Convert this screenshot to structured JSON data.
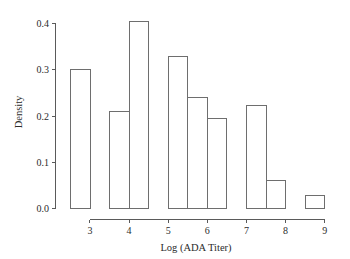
{
  "chart_data": {
    "type": "bar",
    "title": "",
    "subtitle": "",
    "xlabel": "Log (ADA Titer)",
    "ylabel": "Density",
    "xlim": [
      2.35,
      9.15
    ],
    "ylim": [
      0.0,
      0.42
    ],
    "grid": false,
    "legend": null,
    "bin_width": 0.5,
    "x_ticks": [
      3,
      4,
      5,
      6,
      7,
      8,
      9
    ],
    "x_tick_labels": [
      "3",
      "4",
      "5",
      "6",
      "7",
      "8",
      "9"
    ],
    "y_ticks": [
      0.0,
      0.1,
      0.2,
      0.3,
      0.4
    ],
    "y_tick_labels": [
      "0.0",
      "0.1",
      "0.2",
      "0.3",
      "0.4"
    ],
    "bins": [
      {
        "label": "2.5-3.0",
        "x0": 2.5,
        "x1": 3.0,
        "value": 0.3
      },
      {
        "label": "3.0-3.5",
        "x0": 3.0,
        "x1": 3.5,
        "value": 0.0
      },
      {
        "label": "3.5-4.0",
        "x0": 3.5,
        "x1": 4.0,
        "value": 0.21
      },
      {
        "label": "4.0-4.5",
        "x0": 4.0,
        "x1": 4.5,
        "value": 0.405
      },
      {
        "label": "4.5-5.0",
        "x0": 4.5,
        "x1": 5.0,
        "value": 0.0
      },
      {
        "label": "5.0-5.5",
        "x0": 5.0,
        "x1": 5.5,
        "value": 0.33
      },
      {
        "label": "5.5-6.0",
        "x0": 5.5,
        "x1": 6.0,
        "value": 0.24
      },
      {
        "label": "6.0-6.5",
        "x0": 6.0,
        "x1": 6.5,
        "value": 0.195
      },
      {
        "label": "6.5-7.0",
        "x0": 6.5,
        "x1": 7.0,
        "value": 0.0
      },
      {
        "label": "7.0-7.5",
        "x0": 7.0,
        "x1": 7.5,
        "value": 0.224
      },
      {
        "label": "7.5-8.0",
        "x0": 7.5,
        "x1": 8.0,
        "value": 0.06
      },
      {
        "label": "8.0-8.5",
        "x0": 8.0,
        "x1": 8.5,
        "value": 0.0
      },
      {
        "label": "8.5-9.0",
        "x0": 8.5,
        "x1": 9.0,
        "value": 0.028
      }
    ],
    "categories": [
      "2.5-3.0",
      "3.0-3.5",
      "3.5-4.0",
      "4.0-4.5",
      "4.5-5.0",
      "5.0-5.5",
      "5.5-6.0",
      "6.0-6.5",
      "6.5-7.0",
      "7.0-7.5",
      "7.5-8.0",
      "8.0-8.5",
      "8.5-9.0"
    ],
    "values": [
      0.3,
      0.0,
      0.21,
      0.405,
      0.0,
      0.33,
      0.24,
      0.195,
      0.0,
      0.224,
      0.06,
      0.0,
      0.028
    ],
    "colors": {
      "bar_stroke": "#6e6e6e",
      "bar_fill": "none",
      "axis": "#5a5a5a",
      "text": "#2b2b2b",
      "background": "#ffffff"
    }
  }
}
